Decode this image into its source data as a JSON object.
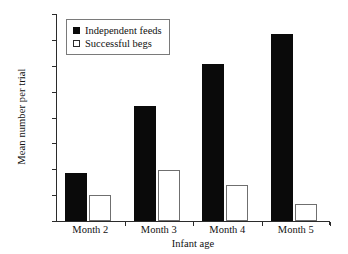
{
  "chart_data": {
    "type": "bar",
    "title": "",
    "subtitle": "",
    "xlabel": "Infant age",
    "ylabel": "Mean number per trial",
    "categories": [
      "Month 2",
      "Month 3",
      "Month 4",
      "Month 5"
    ],
    "series": [
      {
        "name": "Independent feeds",
        "style": "filled",
        "color": "#0a0a0a",
        "values": [
          0.93,
          2.22,
          3.03,
          3.62
        ]
      },
      {
        "name": "Successful begs",
        "style": "open",
        "color": "#ffffff",
        "edge_color": "#6f6f6f",
        "values": [
          0.5,
          0.98,
          0.69,
          0.33
        ]
      }
    ],
    "ylim": [
      0,
      4
    ],
    "yticks": [
      0,
      0.5,
      1,
      1.5,
      2,
      2.5,
      3,
      3.5,
      4
    ],
    "ytick_labels": [
      "0",
      "0.5",
      "1",
      "1.5",
      "2",
      "2.5",
      "3",
      "3.5",
      "4"
    ],
    "grid": false,
    "legend_position": "upper left",
    "axis_style": "left-and-bottom-spines-only",
    "background_color": "#ffffff"
  },
  "legend": {
    "entries": [
      {
        "label": "Independent feeds",
        "swatch": "filled-square-icon"
      },
      {
        "label": "Successful begs",
        "swatch": "open-square-icon"
      }
    ]
  }
}
